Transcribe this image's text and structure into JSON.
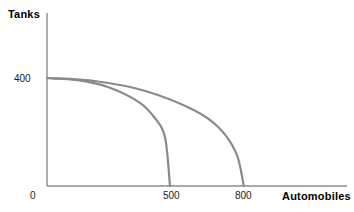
{
  "chart_data": {
    "type": "line",
    "title": "",
    "subtitle": "",
    "xlabel": "Automobiles",
    "ylabel": "Tanks",
    "grid": false,
    "legend": "none",
    "xlim": [
      0,
      900
    ],
    "ylim": [
      0,
      520
    ],
    "xticks": [
      "0",
      "500",
      "800"
    ],
    "xtick_values": [
      0,
      500,
      800
    ],
    "yticks": [
      "400"
    ],
    "ytick_values": [
      400
    ],
    "annotations": [],
    "series": [
      {
        "name": "inner-ppf",
        "curve": "concave",
        "points": [
          [
            0,
            400
          ],
          [
            125,
            392
          ],
          [
            250,
            366
          ],
          [
            375,
            310
          ],
          [
            440,
            250
          ],
          [
            480,
            180
          ],
          [
            500,
            0
          ]
        ],
        "color": "#8a8a8a"
      },
      {
        "name": "outer-ppf",
        "curve": "concave",
        "points": [
          [
            0,
            400
          ],
          [
            200,
            388
          ],
          [
            400,
            352
          ],
          [
            600,
            280
          ],
          [
            700,
            215
          ],
          [
            770,
            120
          ],
          [
            800,
            0
          ]
        ],
        "color": "#8a8a8a"
      }
    ]
  },
  "axes": {
    "y_title": "Tanks",
    "x_title": "Automobiles",
    "y_tick_400": "400",
    "x_tick_0": "0",
    "x_tick_500": "500",
    "x_tick_800": "800"
  },
  "colors": {
    "curve": "#8a8a8a",
    "axis": "#8c8c8c",
    "text": "#000000"
  }
}
